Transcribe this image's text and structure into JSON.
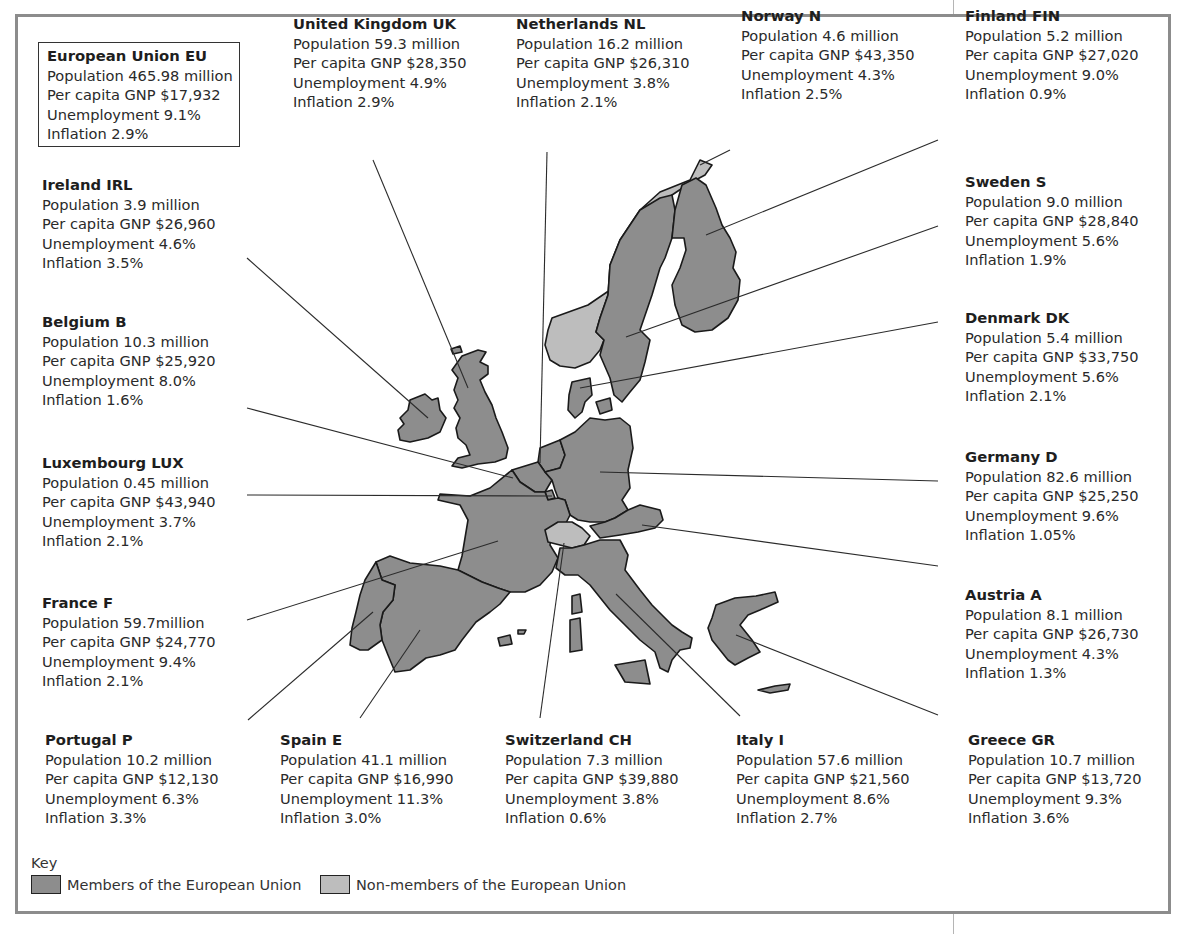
{
  "colors": {
    "member": "#8d8d8d",
    "non_member": "#bdbdbd",
    "border": "#1a1a1a",
    "frame": "#8c8c8c",
    "leader": "#2b2b2b"
  },
  "eu": {
    "name": "European Union EU",
    "population": "Population 465.98 million",
    "gnp": "Per capita GNP $17,932",
    "unemployment": "Unemployment 9.1%",
    "inflation": "Inflation 2.9%"
  },
  "countries": {
    "uk": {
      "name": "United Kingdom UK",
      "population": "Population 59.3 million",
      "gnp": "Per capita GNP $28,350",
      "unemployment": "Unemployment 4.9%",
      "inflation": "Inflation 2.9%",
      "member": true
    },
    "nl": {
      "name": "Netherlands NL",
      "population": "Population 16.2 million",
      "gnp": "Per capita GNP $26,310",
      "unemployment": "Unemployment 3.8%",
      "inflation": "Inflation 2.1%",
      "member": true
    },
    "no": {
      "name": "Norway N",
      "population": "Population 4.6 million",
      "gnp": "Per capita GNP $43,350",
      "unemployment": "Unemployment 4.3%",
      "inflation": "Inflation 2.5%",
      "member": false
    },
    "fi": {
      "name": "Finland FIN",
      "population": "Population 5.2 million",
      "gnp": "Per capita GNP $27,020",
      "unemployment": "Unemployment 9.0%",
      "inflation": "Inflation 0.9%",
      "member": true
    },
    "ie": {
      "name": "Ireland IRL",
      "population": "Population 3.9 million",
      "gnp": "Per capita GNP $26,960",
      "unemployment": "Unemployment 4.6%",
      "inflation": "Inflation 3.5%",
      "member": true
    },
    "se": {
      "name": "Sweden S",
      "population": "Population 9.0 million",
      "gnp": "Per capita GNP $28,840",
      "unemployment": "Unemployment 5.6%",
      "inflation": "Inflation 1.9%",
      "member": true
    },
    "be": {
      "name": "Belgium B",
      "population": "Population 10.3 million",
      "gnp": "Per capita GNP $25,920",
      "unemployment": "Unemployment 8.0%",
      "inflation": "Inflation 1.6%",
      "member": true
    },
    "dk": {
      "name": "Denmark DK",
      "population": "Population 5.4 million",
      "gnp": "Per capita GNP $33,750",
      "unemployment": "Unemployment 5.6%",
      "inflation": "Inflation 2.1%",
      "member": true
    },
    "lu": {
      "name": "Luxembourg LUX",
      "population": "Population 0.45 million",
      "gnp": "Per capita GNP $43,940",
      "unemployment": "Unemployment 3.7%",
      "inflation": "Inflation 2.1%",
      "member": true
    },
    "de": {
      "name": "Germany D",
      "population": "Population 82.6 million",
      "gnp": "Per capita GNP $25,250",
      "unemployment": "Unemployment 9.6%",
      "inflation": "Inflation 1.05%",
      "member": true
    },
    "fr": {
      "name": "France F",
      "population": "Population 59.7million",
      "gnp": "Per capita GNP $24,770",
      "unemployment": "Unemployment 9.4%",
      "inflation": "Inflation 2.1%",
      "member": true
    },
    "at": {
      "name": "Austria A",
      "population": "Population 8.1 million",
      "gnp": "Per capita GNP $26,730",
      "unemployment": "Unemployment 4.3%",
      "inflation": "Inflation 1.3%",
      "member": true
    },
    "pt": {
      "name": "Portugal P",
      "population": "Population 10.2 million",
      "gnp": "Per capita GNP $12,130",
      "unemployment": "Unemployment 6.3%",
      "inflation": "Inflation 3.3%",
      "member": true
    },
    "es": {
      "name": "Spain E",
      "population": "Population 41.1 million",
      "gnp": "Per capita GNP $16,990",
      "unemployment": "Unemployment 11.3%",
      "inflation": "Inflation 3.0%",
      "member": true
    },
    "ch": {
      "name": "Switzerland CH",
      "population": "Population 7.3 million",
      "gnp": "Per capita GNP $39,880",
      "unemployment": "Unemployment 3.8%",
      "inflation": "Inflation 0.6%",
      "member": false
    },
    "it": {
      "name": "Italy I",
      "population": "Population 57.6 million",
      "gnp": "Per capita GNP $21,560",
      "unemployment": "Unemployment 8.6%",
      "inflation": "Inflation 2.7%",
      "member": true
    },
    "gr": {
      "name": "Greece GR",
      "population": "Population 10.7 million",
      "gnp": "Per capita GNP $13,720",
      "unemployment": "Unemployment 9.3%",
      "inflation": "Inflation 3.6%",
      "member": true
    }
  },
  "key": {
    "title": "Key",
    "member_label": "Members of the European Union",
    "non_member_label": "Non-members of the European Union"
  }
}
